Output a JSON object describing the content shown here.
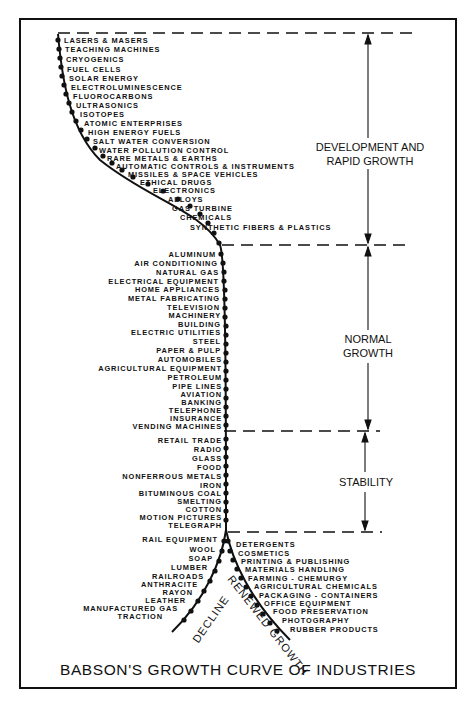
{
  "title": "BABSON'S GROWTH CURVE OF INDUSTRIES",
  "stages": [
    {
      "id": "development",
      "label": "DEVELOPMENT AND RAPID GROWTH",
      "line1": "DEVELOPMENT AND",
      "line2": "RAPID GROWTH"
    },
    {
      "id": "normal",
      "label": "NORMAL GROWTH",
      "line1": "NORMAL",
      "line2": "GROWTH"
    },
    {
      "id": "stability",
      "label": "STABILITY",
      "line1": "STABILITY"
    }
  ],
  "branches": {
    "decline": "DECLINE",
    "renewed": "RENEWED GROWTH"
  },
  "development_industries": [
    "LASERS & MASERS",
    "TEACHING MACHINES",
    "CRYOGENICS",
    "FUEL CELLS",
    "SOLAR ENERGY",
    "ELECTROLUMINESCENCE",
    "FLUOROCARBONS",
    "ULTRASONICS",
    "ISOTOPES",
    "ATOMIC ENTERPRISES",
    "HIGH ENERGY FUELS",
    "SALT WATER CONVERSION",
    "WATER POLLUTION CONTROL",
    "RARE METALS & EARTHS",
    "AUTOMATIC CONTROLS & INSTRUMENTS",
    "MISSILES & SPACE VEHICLES",
    "ETHICAL DRUGS",
    "ELECTRONICS",
    "ALLOYS",
    "GAS TURBINE",
    "CHEMICALS",
    "SYNTHETIC FIBERS & PLASTICS"
  ],
  "normal_growth_industries": [
    "ALUMINUM",
    "AIR CONDITIONING",
    "NATURAL GAS",
    "ELECTRICAL EQUIPMENT",
    "HOME APPLIANCES",
    "METAL FABRICATING",
    "TELEVISION",
    "MACHINERY",
    "BUILDING",
    "ELECTRIC UTILITIES",
    "STEEL",
    "PAPER & PULP",
    "AUTOMOBILES",
    "AGRICULTURAL EQUIPMENT",
    "PETROLEUM",
    "PIPE LINES",
    "AVIATION",
    "BANKING",
    "TELEPHONE",
    "INSURANCE",
    "VENDING MACHINES"
  ],
  "stability_industries": [
    "RETAIL TRADE",
    "RADIO",
    "GLASS",
    "FOOD",
    "NONFERROUS METALS",
    "IRON",
    "BITUMINOUS COAL",
    "SMELTING",
    "COTTON",
    "MOTION PICTURES",
    "TELEGRAPH"
  ],
  "decline_industries": [
    "RAIL EQUIPMENT",
    "WOOL",
    "SOAP",
    "LUMBER",
    "RAILROADS",
    "ANTHRACITE",
    "RAYON",
    "LEATHER",
    "MANUFACTURED GAS",
    "TRACTION"
  ],
  "renewed_growth_industries": [
    "DETERGENTS",
    "COSMETICS",
    "PRINTING & PUBLISHING",
    "MATERIALS HANDLING",
    "FARMING - CHEMURGY",
    "AGRICULTURAL CHEMICALS",
    "PACKAGING - CONTAINERS",
    "OFFICE EQUIPMENT",
    "FOOD PRESERVATION",
    "PHOTOGRAPHY",
    "RUBBER PRODUCTS"
  ]
}
